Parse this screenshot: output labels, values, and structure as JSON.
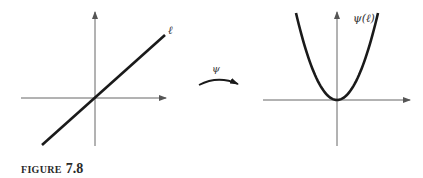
{
  "figure": {
    "caption_word": "FIGURE",
    "caption_number": "7.8"
  },
  "left_plot": {
    "curve_label": "ℓ",
    "curve_type": "line through origin"
  },
  "mapping": {
    "label": "ψ"
  },
  "right_plot": {
    "curve_label": "ψ(ℓ)",
    "curve_type": "parabola with vertex at origin"
  },
  "colors": {
    "axis": "#555555",
    "curve": "#1a1a1a",
    "text": "#333333"
  }
}
